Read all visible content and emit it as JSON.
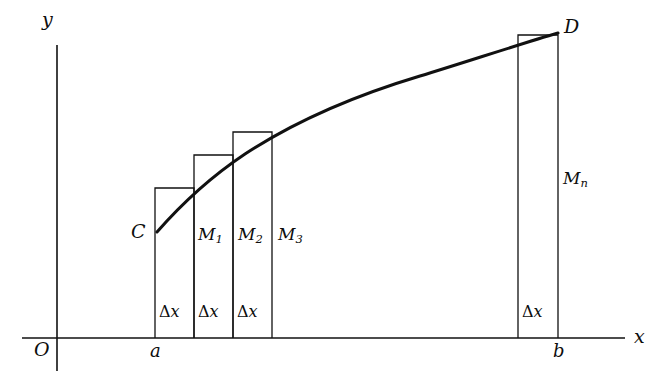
{
  "figure": {
    "kind": "riemann-sum-rectangles-under-curve",
    "background_color": "#ffffff",
    "stroke_color": "#111111",
    "axes": {
      "y_axis_label": "y",
      "x_axis_label": "x",
      "origin_label": "O",
      "y_axis": {
        "x": 57,
        "y_top": 45,
        "y_bottom": 371
      },
      "x_axis": {
        "y": 338,
        "x_left": 22,
        "x_right": 625
      }
    },
    "bounds": {
      "left_label": "a",
      "right_label": "b",
      "left_x": 155,
      "right_x": 558
    },
    "curve": {
      "start_point_label": "C",
      "end_point_label": "D",
      "start": {
        "x": 157,
        "y": 232
      },
      "end": {
        "x": 558,
        "y": 33
      },
      "sample_points": [
        {
          "x": 157,
          "y": 232
        },
        {
          "x": 180,
          "y": 206
        },
        {
          "x": 200,
          "y": 187
        },
        {
          "x": 233,
          "y": 162
        },
        {
          "x": 272,
          "y": 138
        },
        {
          "x": 320,
          "y": 113
        },
        {
          "x": 370,
          "y": 92
        },
        {
          "x": 420,
          "y": 76
        },
        {
          "x": 470,
          "y": 62
        },
        {
          "x": 518,
          "y": 46
        },
        {
          "x": 558,
          "y": 33
        }
      ]
    },
    "rectangles": [
      {
        "name": "rect-1",
        "left": 155,
        "right": 194,
        "top": 188,
        "bottom": 338,
        "label": "C",
        "label_x": 133,
        "label_y": 236
      },
      {
        "name": "rect-2",
        "left": 194,
        "right": 233,
        "top": 155,
        "bottom": 338,
        "label": "M1",
        "label_x": 198,
        "label_y": 242
      },
      {
        "name": "rect-3",
        "left": 233,
        "right": 272,
        "top": 132,
        "bottom": 338,
        "label": "M2",
        "label_x": 238,
        "label_y": 242
      },
      {
        "name": "rect-4",
        "left": 272,
        "right": 272,
        "top": 132,
        "bottom": 338,
        "label": "M3",
        "label_x": 278,
        "label_y": 242
      },
      {
        "name": "rect-n",
        "left": 518,
        "right": 558,
        "top": 35,
        "bottom": 338,
        "label": "Mn",
        "label_x": 563,
        "label_y": 186
      }
    ],
    "labels": {
      "C": "C",
      "D": "D",
      "M1": "M",
      "M1_sub": "1",
      "M2": "M",
      "M2_sub": "2",
      "M3": "M",
      "M3_sub": "3",
      "Mn": "M",
      "Mn_sub": "n",
      "delta": "Δ",
      "delta_var": "x"
    },
    "delta_marks": [
      {
        "name": "delta-x-1",
        "x": 158,
        "y": 313
      },
      {
        "name": "delta-x-2",
        "x": 197,
        "y": 313
      },
      {
        "name": "delta-x-3",
        "x": 236,
        "y": 313
      },
      {
        "name": "delta-x-n",
        "x": 521,
        "y": 313
      }
    ]
  }
}
